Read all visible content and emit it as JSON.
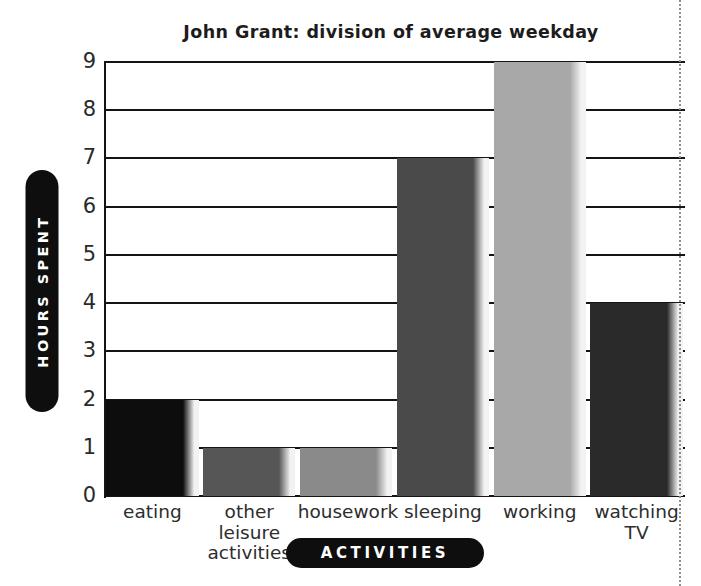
{
  "chart_data": {
    "type": "bar",
    "title": "John Grant: division of average weekday",
    "xlabel": "ACTIVITIES",
    "ylabel": "HOURS SPENT",
    "categories": [
      "eating",
      "other\nleisure\nactivities",
      "housework",
      "sleeping",
      "working",
      "watching\nTV"
    ],
    "values": [
      2,
      1,
      1,
      7,
      9,
      4
    ],
    "ylim": [
      0,
      9
    ],
    "yticks": [
      0,
      1,
      2,
      3,
      4,
      5,
      6,
      7,
      8,
      9
    ],
    "ytick_labels": [
      "0",
      "1",
      "2",
      "3",
      "4",
      "5",
      "6",
      "7",
      "8",
      "9"
    ],
    "grid": true,
    "legend": "none",
    "bar_colors": [
      "#0d0d0d",
      "#565656",
      "#8a8a8a",
      "#4a4a4a",
      "#a8a8a8",
      "#2a2a2a"
    ],
    "bar_highlight_color": "#f2f2f2",
    "axis_color": "#141414",
    "background": "#ffffff",
    "title_color": "#1c1c1c",
    "pill_color": "#0e0e0e",
    "pill_text_color": "#ffffff"
  },
  "bars": [
    {
      "category": "eating",
      "label": "eating",
      "value": 2,
      "color": "#0d0d0d"
    },
    {
      "category": "other leisure activities",
      "label": "other\nleisure\nactivities",
      "value": 1,
      "color": "#565656"
    },
    {
      "category": "housework",
      "label": "housework",
      "value": 1,
      "color": "#8a8a8a"
    },
    {
      "category": "sleeping",
      "label": "sleeping",
      "value": 7,
      "color": "#4a4a4a"
    },
    {
      "category": "working",
      "label": "working",
      "value": 9,
      "color": "#a8a8a8"
    },
    {
      "category": "watching TV",
      "label": "watching\nTV",
      "value": 4,
      "color": "#2a2a2a"
    }
  ]
}
